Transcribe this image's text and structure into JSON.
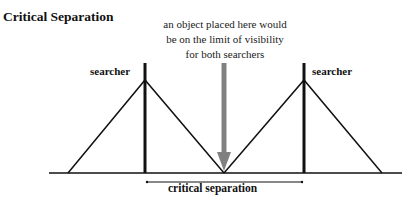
{
  "title": "Critical Separation",
  "annotation": [
    "an object placed here would",
    "be on the limit of visibility",
    "for both searchers"
  ],
  "labels": {
    "left_searcher": "searcher",
    "right_searcher": "searcher",
    "separation": "critical separation"
  },
  "colors": {
    "lines": "#111111",
    "arrow": "#808080"
  }
}
